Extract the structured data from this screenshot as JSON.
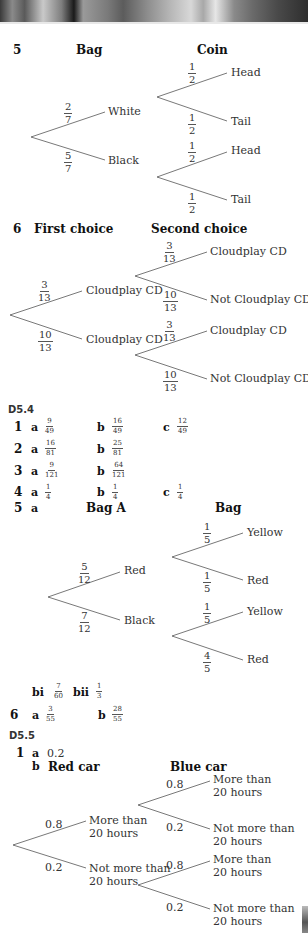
{
  "q5": {
    "number": "5",
    "col1": "Bag",
    "col2": "Coin",
    "first": [
      {
        "label": "White",
        "p": {
          "n": "2",
          "d": "7"
        }
      },
      {
        "label": "Black",
        "p": {
          "n": "5",
          "d": "7"
        }
      }
    ],
    "second": [
      {
        "label": "Head",
        "p": {
          "n": "1",
          "d": "2"
        }
      },
      {
        "label": "Tail",
        "p": {
          "n": "1",
          "d": "2"
        }
      },
      {
        "label": "Head",
        "p": {
          "n": "1",
          "d": "2"
        }
      },
      {
        "label": "Tail",
        "p": {
          "n": "1",
          "d": "2"
        }
      }
    ]
  },
  "q6": {
    "number": "6",
    "col1": "First choice",
    "col2": "Second choice",
    "first": [
      {
        "label": "Cloudplay CD",
        "p": {
          "n": "3",
          "d": "13"
        }
      },
      {
        "label": "Cloudplay CD",
        "p": {
          "n": "10",
          "d": "13"
        }
      }
    ],
    "second": [
      {
        "label": "Cloudplay CD",
        "p": {
          "n": "3",
          "d": "13"
        }
      },
      {
        "label": "Not Cloudplay CD",
        "p": {
          "n": "10",
          "d": "13"
        }
      },
      {
        "label": "Cloudplay CD",
        "p": {
          "n": "3",
          "d": "13"
        }
      },
      {
        "label": "Not Cloudplay CD",
        "p": {
          "n": "10",
          "d": "13"
        }
      }
    ]
  },
  "d54": {
    "heading": "D5.4",
    "rows": [
      {
        "num": "1",
        "a": {
          "n": "9",
          "d": "49"
        },
        "b": {
          "n": "16",
          "d": "49"
        },
        "c": {
          "n": "12",
          "d": "49"
        }
      },
      {
        "num": "2",
        "a": {
          "n": "16",
          "d": "81"
        },
        "b": {
          "n": "25",
          "d": "81"
        }
      },
      {
        "num": "3",
        "a": {
          "n": "9",
          "d": "121"
        },
        "b": {
          "n": "64",
          "d": "121"
        }
      },
      {
        "num": "4",
        "a": {
          "n": "1",
          "d": "4"
        },
        "b": {
          "n": "1",
          "d": "4"
        },
        "c": {
          "n": "1",
          "d": "4"
        }
      }
    ],
    "labels": {
      "a": "a",
      "b": "b",
      "c": "c"
    },
    "q5": {
      "num": "5",
      "part": "a",
      "col1": "Bag A",
      "col2": "Bag",
      "first": [
        {
          "label": "Red",
          "p": {
            "n": "5",
            "d": "12"
          }
        },
        {
          "label": "Black",
          "p": {
            "n": "7",
            "d": "12"
          }
        }
      ],
      "second": [
        {
          "label": "Yellow",
          "p": {
            "n": "1",
            "d": "5"
          }
        },
        {
          "label": "Red",
          "p": {
            "n": "1",
            "d": "5"
          }
        },
        {
          "label": "Yellow",
          "p": {
            "n": "1",
            "d": "5"
          }
        },
        {
          "label": "Red",
          "p": {
            "n": "4",
            "d": "5"
          }
        }
      ],
      "bi_label": "bi",
      "bi": {
        "n": "7",
        "d": "60"
      },
      "bii_label": "bii",
      "bii": {
        "n": "1",
        "d": "3"
      }
    },
    "q6": {
      "num": "6",
      "a": {
        "n": "3",
        "d": "55"
      },
      "b": {
        "n": "28",
        "d": "55"
      }
    }
  },
  "d55": {
    "heading": "D5.5",
    "q1": {
      "num": "1",
      "a_label": "a",
      "a_value": "0.2",
      "b_label": "b",
      "col1": "Red car",
      "col2": "Blue car",
      "first": [
        {
          "label1": "More than",
          "label2": "20 hours",
          "p": "0.8"
        },
        {
          "label1": "Not more than",
          "label2": "20 hours",
          "p": "0.2"
        }
      ],
      "second": [
        {
          "label1": "More than",
          "label2": "20 hours",
          "p": "0.8"
        },
        {
          "label1": "Not more than",
          "label2": "20 hours",
          "p": "0.2"
        },
        {
          "label1": "More than",
          "label2": "20 hours",
          "p": "0.8"
        },
        {
          "label1": "Not more than",
          "label2": "20 hours",
          "p": "0.2"
        }
      ]
    }
  }
}
